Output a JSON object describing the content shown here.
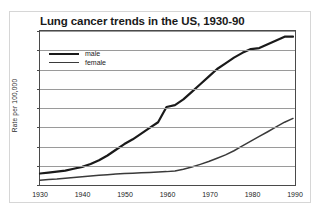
{
  "figure": {
    "top_caption_fragment": "",
    "title": "Lung cancer trends in the US, 1930-90"
  },
  "axes": {
    "ylabel": "Rate per 100,000",
    "yticks": [
      "0",
      "10",
      "20",
      "30",
      "40",
      "50",
      "60",
      "70",
      "80"
    ],
    "xticks": [
      "1930",
      "1940",
      "1950",
      "1960",
      "1970",
      "1980",
      "1990"
    ]
  },
  "legend": {
    "items": [
      {
        "label": "male",
        "color": "#1a1a1a"
      },
      {
        "label": "female",
        "color": "#3a3a3a"
      }
    ]
  },
  "chart_data": {
    "type": "line",
    "title": "Lung cancer trends in the US, 1930-90",
    "xlabel": "",
    "ylabel": "Rate per 100,000",
    "xlim": [
      1930,
      1990
    ],
    "ylim": [
      0,
      80
    ],
    "xticks": [
      1930,
      1940,
      1950,
      1960,
      1970,
      1980,
      1990
    ],
    "yticks": [
      0,
      10,
      20,
      30,
      40,
      50,
      60,
      70,
      80
    ],
    "grid": "horizontal",
    "legend_position": "top-left",
    "x": [
      1930,
      1932,
      1934,
      1936,
      1938,
      1940,
      1942,
      1944,
      1946,
      1948,
      1950,
      1952,
      1954,
      1956,
      1958,
      1960,
      1962,
      1964,
      1966,
      1968,
      1970,
      1972,
      1974,
      1976,
      1978,
      1980,
      1982,
      1984,
      1986,
      1988,
      1990
    ],
    "series": [
      {
        "name": "male",
        "color": "#1a1a1a",
        "values": [
          5,
          5.5,
          6,
          6.5,
          7.5,
          8.5,
          10,
          12,
          14.5,
          17.5,
          20.5,
          23,
          26,
          29,
          32,
          40,
          41,
          44,
          48,
          52,
          56,
          60,
          63,
          66,
          68.5,
          70.5,
          71,
          73,
          75,
          77,
          77
        ]
      },
      {
        "name": "female",
        "color": "#3a3a3a",
        "values": [
          1.5,
          1.8,
          2.1,
          2.5,
          2.9,
          3.3,
          3.7,
          4.1,
          4.4,
          4.7,
          5,
          5.2,
          5.4,
          5.6,
          5.8,
          6,
          6.3,
          7.2,
          8.4,
          9.8,
          11.3,
          13,
          14.8,
          17,
          19.5,
          22,
          24.5,
          27,
          29.5,
          32,
          34
        ]
      }
    ]
  }
}
